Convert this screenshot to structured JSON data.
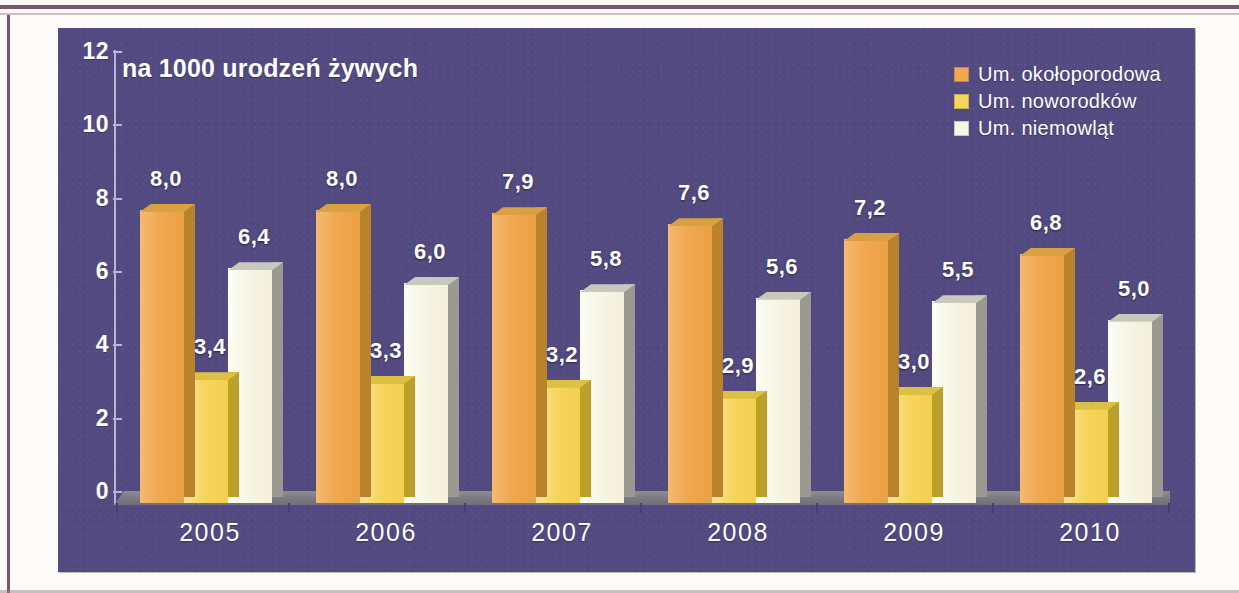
{
  "chart_data": {
    "type": "bar",
    "title": "",
    "axis_note": "na 1000 urodzeń żywych",
    "xlabel": "",
    "ylabel": "na 1000 urodzeń żywych",
    "categories": [
      "2005",
      "2006",
      "2007",
      "2008",
      "2009",
      "2010"
    ],
    "ylim": [
      0,
      12
    ],
    "yticks": [
      "0",
      "2",
      "4",
      "6",
      "8",
      "10",
      "12"
    ],
    "ytick_values": [
      0,
      2,
      4,
      6,
      8,
      10,
      12
    ],
    "grid": false,
    "legend_position": "top-right",
    "series": [
      {
        "name": "Um. okołoporodowa",
        "color": "#f0a850",
        "values": [
          8.0,
          8.0,
          7.9,
          7.6,
          7.2,
          6.8
        ],
        "labels": [
          "8,0",
          "8,0",
          "7,9",
          "7,6",
          "7,2",
          "6,8"
        ]
      },
      {
        "name": "Um. noworodków",
        "color": "#f6d55f",
        "values": [
          3.4,
          3.3,
          3.2,
          2.9,
          3.0,
          2.6
        ],
        "labels": [
          "3,4",
          "3,3",
          "3,2",
          "2,9",
          "3,0",
          "2,6"
        ]
      },
      {
        "name": "Um. niemowląt",
        "color": "#f7f5e4",
        "values": [
          6.4,
          6.0,
          5.8,
          5.6,
          5.5,
          5.0
        ],
        "labels": [
          "6,4",
          "6,0",
          "5,8",
          "5,6",
          "5,5",
          "5,0"
        ]
      }
    ]
  },
  "panel": {
    "background_color": "#524a80",
    "axis_color": "#b9b3d8",
    "text_color": "#ffffff"
  },
  "page": {
    "rule_color": "#7b5668",
    "paper_color": "#fcfbf8"
  }
}
